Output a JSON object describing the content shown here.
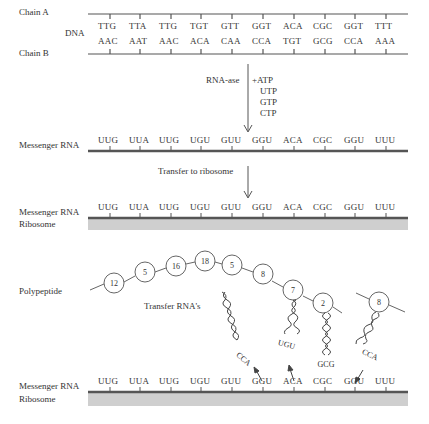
{
  "dna": {
    "chain_a_label": "Chain A",
    "chain_b_label": "Chain B",
    "dna_label": "DNA",
    "chain_a_codons": [
      "TTG",
      "TTA",
      "TTG",
      "TGT",
      "GTT",
      "GGT",
      "ACA",
      "CGC",
      "GGT",
      "TTT"
    ],
    "chain_b_codons": [
      "AAC",
      "AAT",
      "AAC",
      "ACA",
      "CAA",
      "CCA",
      "TGT",
      "GCG",
      "CCA",
      "AAA"
    ]
  },
  "transcription": {
    "enzyme_label": "RNA-ase",
    "substrates": [
      "+ATP",
      "UTP",
      "GTP",
      "CTP"
    ]
  },
  "mrna_1": {
    "label": "Messenger RNA",
    "codons": [
      "UUG",
      "UUA",
      "UUG",
      "UGU",
      "GUU",
      "GGU",
      "ACA",
      "CGC",
      "GGU",
      "UUU"
    ]
  },
  "transfer": {
    "label": "Transfer to ribosome"
  },
  "mrna_2": {
    "label": "Messenger RNA",
    "ribosome_label": "Ribosome",
    "codons": [
      "UUG",
      "UUA",
      "UUG",
      "UGU",
      "GUU",
      "GGU",
      "ACA",
      "CGC",
      "GGU",
      "UUU"
    ]
  },
  "translation": {
    "polypeptide_label": "Polypeptide",
    "amino_acids": [
      "12",
      "5",
      "16",
      "18",
      "5",
      "8",
      "7",
      "2",
      "8"
    ],
    "trna_label": "Transfer RNA's",
    "anticodons": [
      "CCA",
      "UGU",
      "GCG",
      "CCA"
    ]
  },
  "mrna_3": {
    "label": "Messenger RNA",
    "ribosome_label": "Ribosome",
    "codons": [
      "UUG",
      "UUA",
      "UUG",
      "UGU",
      "GUU",
      "GGU",
      "ACA",
      "CGC",
      "GGU",
      "UUU"
    ]
  },
  "colors": {
    "strand": "#555555",
    "ribosome": "#cfcfcf",
    "text": "#333333"
  }
}
